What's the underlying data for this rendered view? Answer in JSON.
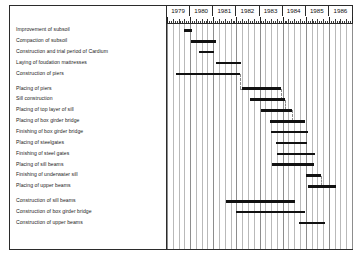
{
  "chart_data": {
    "type": "bar",
    "chart_kind": "gantt",
    "title": "",
    "xlabel": "",
    "ylabel": "",
    "xlim": [
      1979.0,
      1987.0
    ],
    "grid": true,
    "legend": "none",
    "axis": {
      "years": [
        "1979",
        "1980",
        "1981",
        "1982",
        "1983",
        "1984",
        "1985",
        "1986"
      ],
      "tick_unit": "month",
      "ticks_per_year": 12,
      "gridlines_per_year": 4
    },
    "categories": [
      "Improvement of subsoil",
      "Compaction of subsoil",
      "Construction and trial period of Cardium",
      "Laying of foudation mattresses",
      "Construction of piers",
      "Placing of piers",
      "Sill construction",
      "Placing of top layer of sill",
      "Placing of box girder bridge",
      "Finishing of box girder bridge",
      "Placing of steelgates",
      "Finishing of steel gates",
      "Placing of sill beams",
      "Finishing of underwater sill",
      "Placing of upper beams",
      "Construction of sill beams",
      "Construction of box girder bridge",
      "Construction of upper beams"
    ],
    "tasks": [
      {
        "label": "Improvement of subsoil",
        "start": 1979.75,
        "end": 1980.1,
        "group": 0
      },
      {
        "label": "Compaction of subsoil",
        "start": 1980.05,
        "end": 1981.1,
        "group": 0
      },
      {
        "label": "Construction and trial period of Cardium",
        "start": 1980.4,
        "end": 1981.05,
        "group": 0
      },
      {
        "label": "Laying of foudation mattresses",
        "start": 1981.1,
        "end": 1982.2,
        "group": 0
      },
      {
        "label": "Construction of piers",
        "start": 1979.4,
        "end": 1982.15,
        "group": 0
      },
      {
        "label": "Placing of piers",
        "start": 1982.25,
        "end": 1983.95,
        "group": 1
      },
      {
        "label": "Sill construction",
        "start": 1982.6,
        "end": 1984.1,
        "group": 1
      },
      {
        "label": "Placing of top layer of sill",
        "start": 1983.05,
        "end": 1984.4,
        "group": 1
      },
      {
        "label": "Placing of box girder bridge",
        "start": 1983.45,
        "end": 1984.95,
        "group": 1
      },
      {
        "label": "Finishing of box girder bridge",
        "start": 1983.5,
        "end": 1985.1,
        "group": 1
      },
      {
        "label": "Placing of steelgates",
        "start": 1983.7,
        "end": 1985.05,
        "group": 1
      },
      {
        "label": "Finishing of steel gates",
        "start": 1983.75,
        "end": 1985.4,
        "group": 1
      },
      {
        "label": "Placing of sill beams",
        "start": 1983.55,
        "end": 1985.35,
        "group": 1
      },
      {
        "label": "Finishing of underwater sill",
        "start": 1985.0,
        "end": 1985.65,
        "group": 1
      },
      {
        "label": "Placing of upper beams",
        "start": 1985.1,
        "end": 1986.3,
        "group": 1
      },
      {
        "label": "Construction of sill beams",
        "start": 1981.55,
        "end": 1984.55,
        "group": 2
      },
      {
        "label": "Construction of box girder bridge",
        "start": 1982.0,
        "end": 1984.95,
        "group": 2
      },
      {
        "label": "Construction of upper beams",
        "start": 1984.7,
        "end": 1985.85,
        "group": 2
      }
    ],
    "dependencies": [
      {
        "from": 4,
        "to": 5
      },
      {
        "from": 5,
        "to": 6
      },
      {
        "from": 6,
        "to": 7
      },
      {
        "from": 7,
        "to": 8
      },
      {
        "from": 13,
        "to": 14
      }
    ]
  }
}
